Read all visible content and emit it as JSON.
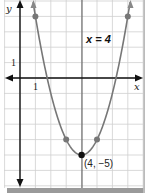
{
  "chart_data": {
    "type": "line",
    "title": "",
    "function": "y = (x - 4)^2 - 5",
    "xlabel": "x",
    "ylabel": "y",
    "x_tick_label": "1",
    "y_tick_label": "1",
    "axis_of_symmetry_label": "x = 4",
    "vertex_label": "(4, −5)",
    "vertex": [
      4,
      -5
    ],
    "points": [
      {
        "x": 1,
        "y": 4
      },
      {
        "x": 3,
        "y": -4
      },
      {
        "x": 4,
        "y": -5
      },
      {
        "x": 5,
        "y": -4
      },
      {
        "x": 7,
        "y": 4
      }
    ],
    "xlim": [
      -1,
      8
    ],
    "ylim": [
      -7,
      5
    ],
    "grid": true,
    "colors": {
      "curve": "#777777",
      "points": "#777777",
      "vertex": "#111111",
      "grid": "#cccccc",
      "axis": "#111111",
      "shadow": "#999999"
    }
  }
}
